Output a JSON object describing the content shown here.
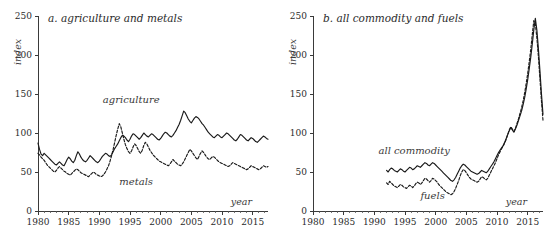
{
  "figure": {
    "width": 550,
    "height": 240,
    "background": "#ffffff",
    "ink_color": "#1a1a1a"
  },
  "chart_data": [
    {
      "type": "line",
      "panel_id": "a",
      "title": "a. agriculture and metals",
      "xlabel": "year",
      "ylabel": "index",
      "xlim": [
        1980,
        2017.5
      ],
      "ylim": [
        0,
        250
      ],
      "xticks": [
        1980,
        1985,
        1990,
        1995,
        2000,
        2005,
        2010,
        2015
      ],
      "yticks": [
        0,
        50,
        100,
        150,
        200,
        250
      ],
      "minor_xtick_step": 1,
      "grid": false,
      "legend": "inline-annotations",
      "annotations": [
        {
          "text": "agriculture",
          "x": 1995.2,
          "y": 139
        },
        {
          "text": "metals",
          "x": 1996.0,
          "y": 33
        }
      ],
      "series": [
        {
          "name": "agriculture",
          "style": "solid",
          "label_position": {
            "x": 1995.2,
            "y": 139
          },
          "x_start": 1980.0,
          "x_step": 0.25,
          "values": [
            87,
            79,
            73,
            71,
            74,
            72,
            70,
            68,
            66,
            64,
            62,
            60,
            59,
            61,
            63,
            61,
            59,
            58,
            62,
            66,
            69,
            67,
            64,
            62,
            65,
            71,
            76,
            73,
            69,
            66,
            64,
            63,
            65,
            68,
            71,
            69,
            67,
            65,
            63,
            62,
            64,
            67,
            70,
            72,
            74,
            73,
            71,
            70,
            72,
            76,
            80,
            83,
            86,
            90,
            94,
            97,
            96,
            94,
            91,
            89,
            92,
            96,
            99,
            98,
            96,
            94,
            92,
            94,
            97,
            100,
            98,
            96,
            95,
            97,
            99,
            98,
            96,
            94,
            92,
            91,
            93,
            96,
            99,
            101,
            100,
            98,
            96,
            95,
            97,
            100,
            103,
            107,
            111,
            116,
            122,
            128,
            126,
            122,
            118,
            115,
            113,
            116,
            119,
            121,
            120,
            118,
            115,
            112,
            110,
            107,
            104,
            101,
            99,
            97,
            95,
            94,
            96,
            98,
            97,
            95,
            94,
            96,
            98,
            100,
            99,
            97,
            95,
            93,
            91,
            90,
            92,
            95,
            98,
            97,
            95,
            93,
            91,
            90,
            92,
            94,
            93,
            91,
            89,
            88,
            90,
            92,
            94,
            96,
            95,
            93,
            92,
            91,
            93,
            96,
            99,
            102,
            105,
            109,
            113,
            117,
            116,
            114,
            112,
            110,
            112,
            115,
            118,
            121,
            124,
            128,
            133,
            139,
            147,
            156,
            168,
            182,
            196,
            205,
            198,
            186,
            172,
            158,
            145,
            132,
            120,
            110,
            103,
            98,
            95,
            97,
            101,
            106,
            112,
            118,
            124,
            130,
            136,
            143,
            152,
            163,
            172,
            168,
            160,
            152,
            145,
            140,
            136,
            133,
            131,
            130,
            132,
            134,
            136,
            137,
            136,
            134,
            132,
            130,
            128,
            126,
            124,
            121,
            118,
            114,
            110,
            106,
            103,
            100,
            103,
            107,
            111,
            115,
            118,
            120,
            119,
            117,
            115,
            113,
            114,
            117
          ]
        },
        {
          "name": "metals",
          "style": "dashed",
          "label_position": {
            "x": 1996.0,
            "y": 33
          },
          "x_start": 1980.0,
          "x_step": 0.25,
          "values": [
            74,
            72,
            69,
            67,
            65,
            62,
            59,
            57,
            55,
            53,
            51,
            50,
            52,
            55,
            57,
            55,
            53,
            51,
            50,
            48,
            47,
            46,
            48,
            50,
            52,
            54,
            53,
            51,
            49,
            48,
            47,
            46,
            45,
            44,
            46,
            48,
            50,
            49,
            47,
            46,
            45,
            44,
            45,
            47,
            50,
            54,
            58,
            64,
            71,
            79,
            88,
            97,
            105,
            112,
            108,
            100,
            92,
            85,
            80,
            76,
            74,
            77,
            82,
            86,
            84,
            80,
            76,
            74,
            78,
            84,
            88,
            86,
            82,
            78,
            75,
            72,
            70,
            68,
            66,
            64,
            63,
            62,
            61,
            60,
            59,
            58,
            60,
            63,
            66,
            64,
            62,
            60,
            59,
            58,
            60,
            63,
            67,
            71,
            75,
            79,
            77,
            74,
            71,
            68,
            66,
            70,
            74,
            77,
            75,
            72,
            69,
            67,
            66,
            68,
            70,
            69,
            67,
            65,
            63,
            62,
            61,
            60,
            59,
            58,
            57,
            58,
            60,
            62,
            61,
            60,
            59,
            58,
            57,
            56,
            55,
            54,
            53,
            54,
            56,
            58,
            57,
            56,
            55,
            54,
            53,
            54,
            56,
            58,
            57,
            56,
            57,
            60,
            64,
            68,
            73,
            79,
            86,
            94,
            103,
            112,
            118,
            124,
            131,
            139,
            148,
            158,
            170,
            184,
            196,
            203,
            198,
            188,
            176,
            190,
            203,
            198,
            186,
            172,
            158,
            140,
            122,
            108,
            98,
            110,
            126,
            142,
            158,
            174,
            190,
            204,
            196,
            188,
            196,
            208,
            222,
            238,
            252,
            246,
            234,
            220,
            206,
            196,
            188,
            182,
            186,
            192,
            198,
            204,
            196,
            188,
            180,
            176,
            180,
            186,
            178,
            170,
            164,
            158,
            152,
            146,
            140,
            134,
            128,
            124,
            120,
            116,
            112,
            108,
            104,
            100,
            104,
            110,
            118,
            126,
            134,
            142,
            146,
            138,
            128,
            134
          ]
        }
      ]
    },
    {
      "type": "line",
      "panel_id": "b",
      "title": "b. all commodity and fuels",
      "xlabel": "year",
      "ylabel": "index",
      "xlim": [
        1980,
        2017.5
      ],
      "ylim": [
        0,
        250
      ],
      "xticks": [
        1980,
        1985,
        1990,
        1995,
        2000,
        2005,
        2010,
        2015
      ],
      "yticks": [
        0,
        50,
        100,
        150,
        200,
        250
      ],
      "minor_xtick_step": 1,
      "grid": false,
      "legend": "inline-annotations",
      "annotations": [
        {
          "text": "all commodity",
          "x": 1996.5,
          "y": 73
        },
        {
          "text": "fuels",
          "x": 1999.5,
          "y": 15
        }
      ],
      "series": [
        {
          "name": "all commodity",
          "style": "solid",
          "label_position": {
            "x": 1996.5,
            "y": 73
          },
          "x_start": 1992.0,
          "x_step": 0.25,
          "values": [
            52,
            50,
            53,
            55,
            54,
            52,
            51,
            50,
            52,
            54,
            53,
            51,
            50,
            52,
            54,
            56,
            55,
            53,
            54,
            56,
            58,
            57,
            56,
            58,
            60,
            62,
            61,
            59,
            58,
            60,
            62,
            61,
            59,
            57,
            55,
            53,
            51,
            49,
            47,
            45,
            43,
            41,
            39,
            38,
            40,
            43,
            47,
            51,
            55,
            58,
            60,
            59,
            57,
            55,
            53,
            51,
            50,
            49,
            48,
            47,
            48,
            50,
            52,
            51,
            50,
            49,
            51,
            54,
            57,
            60,
            63,
            67,
            71,
            75,
            78,
            81,
            84,
            88,
            93,
            98,
            103,
            107,
            104,
            101,
            105,
            110,
            116,
            122,
            128,
            136,
            145,
            156,
            168,
            182,
            197,
            214,
            232,
            247,
            232,
            208,
            180,
            150,
            124,
            104,
            92,
            98,
            110,
            124,
            136,
            146,
            152,
            148,
            144,
            148,
            156,
            168,
            180,
            192,
            200,
            196,
            192,
            188,
            192,
            198,
            194,
            188,
            184,
            188,
            192,
            188,
            184,
            188,
            192,
            186,
            182,
            186,
            190,
            186,
            182,
            178,
            176,
            180,
            184,
            180,
            176,
            170,
            160,
            146,
            132,
            120,
            112,
            108,
            104,
            100,
            96,
            88,
            78,
            68,
            62,
            66,
            72,
            80,
            88,
            96,
            104,
            110,
            106,
            100,
            96,
            94,
            98,
            104,
            108,
            104,
            100,
            98,
            96,
            98,
            102,
            106
          ]
        },
        {
          "name": "fuels",
          "style": "dashed",
          "label_position": {
            "x": 1999.5,
            "y": 15
          },
          "x_start": 1992.0,
          "x_step": 0.25,
          "values": [
            36,
            34,
            38,
            36,
            34,
            32,
            31,
            30,
            32,
            34,
            33,
            31,
            30,
            29,
            31,
            33,
            32,
            30,
            32,
            35,
            37,
            36,
            34,
            36,
            39,
            42,
            41,
            39,
            37,
            39,
            42,
            41,
            39,
            37,
            34,
            32,
            30,
            28,
            26,
            24,
            23,
            22,
            21,
            22,
            25,
            29,
            34,
            39,
            45,
            50,
            53,
            52,
            49,
            46,
            43,
            41,
            40,
            39,
            38,
            37,
            38,
            41,
            44,
            43,
            41,
            40,
            42,
            46,
            50,
            54,
            58,
            62,
            67,
            72,
            76,
            80,
            83,
            87,
            92,
            98,
            104,
            108,
            105,
            102,
            106,
            112,
            118,
            125,
            132,
            141,
            151,
            163,
            176,
            191,
            207,
            226,
            244,
            240,
            222,
            198,
            170,
            141,
            116,
            97,
            86,
            92,
            105,
            120,
            133,
            144,
            150,
            146,
            142,
            146,
            155,
            168,
            182,
            195,
            205,
            200,
            195,
            190,
            196,
            203,
            198,
            190,
            186,
            191,
            196,
            191,
            186,
            190,
            196,
            189,
            184,
            189,
            194,
            189,
            184,
            180,
            178,
            183,
            188,
            183,
            178,
            171,
            159,
            143,
            127,
            114,
            105,
            100,
            96,
            92,
            87,
            78,
            67,
            58,
            61,
            66,
            73,
            82,
            91,
            100,
            108,
            114,
            109,
            101,
            96,
            93,
            98,
            105,
            110,
            105,
            100,
            97,
            94,
            96,
            100,
            104
          ]
        }
      ]
    }
  ]
}
